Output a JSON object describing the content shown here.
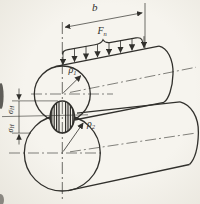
{
  "figure": {
    "dimension_b": "b",
    "force": {
      "main": "F",
      "sub": "n"
    },
    "radius1": {
      "main": "ρ",
      "sub": "1"
    },
    "radius2": {
      "main": "ρ",
      "sub": "2"
    },
    "stress_upper": {
      "main": "σ",
      "sub": "H"
    },
    "stress_lower": {
      "main": "σ",
      "sub": "H"
    },
    "colors": {
      "ink": "#31302c",
      "paper": "#f3f1ea"
    }
  }
}
